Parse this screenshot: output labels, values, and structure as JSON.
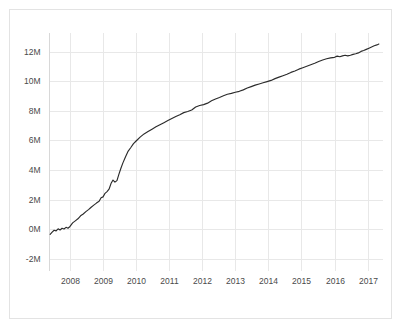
{
  "figure": {
    "background_color": "#ffffff",
    "frame_color": "#e3e3e3",
    "grid_color": "#e8e8e8",
    "line_color": "#2b2b2b",
    "tick_text_color": "#4a4a4a"
  },
  "chart_data": {
    "type": "line",
    "title": "",
    "subtitle": "",
    "xlabel": "",
    "ylabel": "",
    "xlim": [
      2007.35,
      2017.45
    ],
    "ylim": [
      -2800000,
      13300000
    ],
    "grid": true,
    "legend": false,
    "legend_position": "none",
    "x_tick_labels": [
      "2008",
      "2009",
      "2010",
      "2011",
      "2012",
      "2013",
      "2014",
      "2015",
      "2016",
      "2017"
    ],
    "x_tick_values": [
      2008,
      2009,
      2010,
      2011,
      2012,
      2013,
      2014,
      2015,
      2016,
      2017
    ],
    "y_tick_labels": [
      "12M",
      "10M",
      "8M",
      "6M",
      "4M",
      "2M",
      "0M",
      "-2M"
    ],
    "y_tick_values": [
      12000000,
      10000000,
      8000000,
      6000000,
      4000000,
      2000000,
      0,
      -2000000
    ],
    "series": [
      {
        "name": "cumulative total",
        "x": [
          2007.4,
          2007.46,
          2007.52,
          2007.58,
          2007.64,
          2007.7,
          2007.76,
          2007.82,
          2007.88,
          2007.94,
          2008.0,
          2008.08,
          2008.16,
          2008.24,
          2008.32,
          2008.4,
          2008.48,
          2008.56,
          2008.64,
          2008.72,
          2008.8,
          2008.88,
          2008.94,
          2009.0,
          2009.06,
          2009.12,
          2009.18,
          2009.24,
          2009.3,
          2009.36,
          2009.42,
          2009.48,
          2009.54,
          2009.6,
          2009.68,
          2009.76,
          2009.84,
          2009.92,
          2010.0,
          2010.12,
          2010.24,
          2010.36,
          2010.48,
          2010.6,
          2010.72,
          2010.84,
          2010.96,
          2011.08,
          2011.2,
          2011.32,
          2011.44,
          2011.56,
          2011.68,
          2011.8,
          2011.92,
          2012.04,
          2012.16,
          2012.28,
          2012.4,
          2012.52,
          2012.64,
          2012.76,
          2012.88,
          2013.0,
          2013.12,
          2013.24,
          2013.36,
          2013.48,
          2013.6,
          2013.72,
          2013.84,
          2013.96,
          2014.08,
          2014.2,
          2014.32,
          2014.44,
          2014.56,
          2014.68,
          2014.8,
          2014.92,
          2015.04,
          2015.16,
          2015.28,
          2015.4,
          2015.52,
          2015.64,
          2015.76,
          2015.88,
          2016.0,
          2016.08,
          2016.16,
          2016.24,
          2016.32,
          2016.4,
          2016.48,
          2016.56,
          2016.64,
          2016.72,
          2016.8,
          2016.88,
          2016.96,
          2017.04,
          2017.12,
          2017.2,
          2017.28,
          2017.34
        ],
        "y": [
          -350000,
          -200000,
          -80000,
          -120000,
          20000,
          -60000,
          60000,
          10000,
          120000,
          60000,
          180000,
          420000,
          560000,
          700000,
          900000,
          1020000,
          1180000,
          1320000,
          1480000,
          1620000,
          1760000,
          1880000,
          2120000,
          2180000,
          2420000,
          2540000,
          2700000,
          3080000,
          3320000,
          3180000,
          3280000,
          3720000,
          4120000,
          4480000,
          4900000,
          5280000,
          5520000,
          5780000,
          5960000,
          6220000,
          6440000,
          6600000,
          6760000,
          6920000,
          7060000,
          7200000,
          7340000,
          7480000,
          7620000,
          7740000,
          7880000,
          7960000,
          8060000,
          8260000,
          8360000,
          8420000,
          8520000,
          8680000,
          8800000,
          8900000,
          9020000,
          9120000,
          9180000,
          9260000,
          9320000,
          9420000,
          9540000,
          9640000,
          9740000,
          9820000,
          9900000,
          9980000,
          10060000,
          10180000,
          10280000,
          10380000,
          10480000,
          10600000,
          10700000,
          10820000,
          10920000,
          11020000,
          11120000,
          11220000,
          11340000,
          11440000,
          11520000,
          11580000,
          11620000,
          11700000,
          11660000,
          11720000,
          11760000,
          11720000,
          11760000,
          11820000,
          11860000,
          11920000,
          12020000,
          12080000,
          12160000,
          12240000,
          12320000,
          12400000,
          12460000,
          12520000
        ]
      }
    ]
  }
}
